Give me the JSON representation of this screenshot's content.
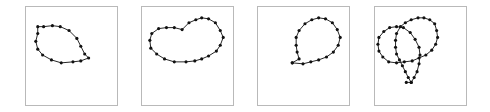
{
  "figure": {
    "stroke_color": "#222222",
    "dot_color": "#111111",
    "frame_color": "#b9b9b9",
    "panels": [
      {
        "id": "teardrop",
        "frame": {
          "x": 25,
          "y": 6,
          "w": 93,
          "h": 100
        },
        "points": [
          [
            12,
            20
          ],
          [
            18,
            20
          ],
          [
            27,
            19
          ],
          [
            35,
            20
          ],
          [
            44,
            24
          ],
          [
            52,
            32
          ],
          [
            56,
            40
          ],
          [
            60,
            48
          ],
          [
            64,
            52
          ],
          [
            56,
            55
          ],
          [
            48,
            56
          ],
          [
            36,
            57
          ],
          [
            26,
            54
          ],
          [
            17,
            49
          ],
          [
            12,
            43
          ],
          [
            10,
            35
          ],
          [
            12,
            27
          ]
        ]
      },
      {
        "id": "kidney",
        "frame": {
          "x": 141,
          "y": 6,
          "w": 93,
          "h": 100
        },
        "points": [
          [
            17,
            22
          ],
          [
            25,
            21
          ],
          [
            33,
            21
          ],
          [
            41,
            23
          ],
          [
            48,
            16
          ],
          [
            55,
            13
          ],
          [
            61,
            11
          ],
          [
            68,
            12
          ],
          [
            75,
            16
          ],
          [
            80,
            24
          ],
          [
            83,
            31
          ],
          [
            80,
            39
          ],
          [
            76,
            45
          ],
          [
            68,
            50
          ],
          [
            61,
            53
          ],
          [
            54,
            55
          ],
          [
            45,
            56
          ],
          [
            33,
            56
          ],
          [
            23,
            53
          ],
          [
            15,
            48
          ],
          [
            9,
            42
          ],
          [
            8,
            34
          ],
          [
            10,
            27
          ]
        ]
      },
      {
        "id": "loop-with-tail",
        "frame": {
          "x": 257,
          "y": 6,
          "w": 93,
          "h": 100
        },
        "points": [
          [
            35,
            57
          ],
          [
            46,
            58
          ],
          [
            54,
            56
          ],
          [
            62,
            54
          ],
          [
            70,
            51
          ],
          [
            77,
            46
          ],
          [
            82,
            39
          ],
          [
            84,
            31
          ],
          [
            81,
            23
          ],
          [
            76,
            16
          ],
          [
            69,
            12
          ],
          [
            62,
            11
          ],
          [
            55,
            13
          ],
          [
            48,
            17
          ],
          [
            42,
            24
          ],
          [
            39,
            31
          ],
          [
            39,
            39
          ],
          [
            40,
            46
          ],
          [
            42,
            53
          ],
          [
            35,
            57
          ]
        ],
        "open": true
      },
      {
        "id": "double-loop-knot",
        "frame": {
          "x": 374,
          "y": 6,
          "w": 93,
          "h": 100
        },
        "points": [
          [
            32,
            77
          ],
          [
            37,
            77
          ],
          [
            34,
            72
          ],
          [
            31,
            66
          ],
          [
            28,
            60
          ],
          [
            25,
            54
          ],
          [
            22,
            48
          ],
          [
            21,
            41
          ],
          [
            21,
            34
          ],
          [
            22,
            27
          ],
          [
            26,
            20
          ],
          [
            31,
            16
          ],
          [
            37,
            13
          ],
          [
            44,
            11
          ],
          [
            50,
            11
          ],
          [
            56,
            13
          ],
          [
            61,
            17
          ],
          [
            63,
            24
          ],
          [
            64,
            31
          ],
          [
            62,
            38
          ],
          [
            58,
            44
          ],
          [
            52,
            49
          ],
          [
            45,
            52
          ],
          [
            38,
            55
          ],
          [
            30,
            56
          ],
          [
            22,
            57
          ],
          [
            14,
            56
          ],
          [
            8,
            51
          ],
          [
            4,
            45
          ],
          [
            3,
            38
          ],
          [
            4,
            31
          ],
          [
            9,
            25
          ],
          [
            15,
            21
          ],
          [
            22,
            20
          ],
          [
            29,
            21
          ],
          [
            36,
            26
          ],
          [
            41,
            33
          ],
          [
            45,
            41
          ],
          [
            46,
            49
          ],
          [
            45,
            58
          ],
          [
            43,
            66
          ],
          [
            40,
            72
          ],
          [
            37,
            77
          ]
        ],
        "open": true
      }
    ]
  }
}
